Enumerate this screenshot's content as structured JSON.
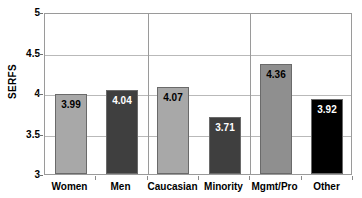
{
  "chart_data": {
    "type": "bar",
    "title": "",
    "xlabel": "",
    "ylabel": "SERFS",
    "ylim": [
      3,
      5
    ],
    "yticks": [
      "3",
      "3.5",
      "4",
      "4.5",
      "5"
    ],
    "grid": true,
    "legend": "none",
    "categories": [
      "Women",
      "Men",
      "Caucasian",
      "Minority",
      "Mgmt/Pro",
      "Other"
    ],
    "values": [
      3.99,
      4.04,
      4.07,
      3.71,
      4.36,
      3.92
    ],
    "value_labels": [
      "3.99",
      "4.04",
      "4.07",
      "3.71",
      "4.36",
      "3.92"
    ],
    "bar_colors": [
      "#a8a8a8",
      "#3f3f3f",
      "#a8a8a8",
      "#3f3f3f",
      "#8f8f8f",
      "#000000"
    ],
    "label_colors": [
      "#000000",
      "#ffffff",
      "#000000",
      "#ffffff",
      "#000000",
      "#ffffff"
    ],
    "group_separators": 2
  }
}
